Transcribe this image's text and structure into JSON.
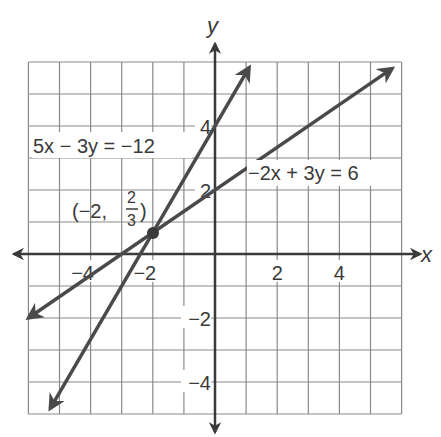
{
  "chart_data": {
    "type": "line",
    "title": "",
    "xlabel": "x",
    "ylabel": "y",
    "xlim": [
      -6,
      6
    ],
    "ylim": [
      -5,
      6
    ],
    "grid": true,
    "grid_step": 1,
    "x_ticks": [
      {
        "value": -4,
        "label": "−4"
      },
      {
        "value": -2,
        "label": "−2"
      },
      {
        "value": 2,
        "label": "2"
      },
      {
        "value": 4,
        "label": "4"
      }
    ],
    "y_ticks": [
      {
        "value": 4,
        "label": "4"
      },
      {
        "value": 2,
        "label": "2"
      },
      {
        "value": -2,
        "label": "−2"
      },
      {
        "value": -4,
        "label": "−4"
      }
    ],
    "series": [
      {
        "name": "5x − 3y = −12",
        "equation": "y = (5/3)x + 4",
        "slope": 1.6667,
        "intercept": 4,
        "x": [
          -5.3,
          1.1
        ],
        "y": [
          -4.83,
          5.83
        ]
      },
      {
        "name": "−2x + 3y = 6",
        "equation": "y = (2/3)x + 2",
        "slope": 0.6667,
        "intercept": 2,
        "x": [
          -6,
          5.7
        ],
        "y": [
          -2,
          5.8
        ]
      }
    ],
    "annotations": [
      {
        "text": "5x − 3y = −12",
        "x": -5.8,
        "y": 3.2
      },
      {
        "text": "−2x + 3y = 6",
        "x": 0.2,
        "y": 2.3
      },
      {
        "text": "(−2, 2/3)",
        "point": [
          -2,
          0.6667
        ],
        "x": -4.4,
        "y": 1.2
      }
    ],
    "intersection": {
      "x": -2,
      "y": 0.6667,
      "label_prefix": "(−2,",
      "frac_num": "2",
      "frac_den": "3",
      "label_suffix": ")"
    }
  },
  "labels": {
    "x_axis": "x",
    "y_axis": "y",
    "eq1": "5x − 3y = −12",
    "eq2": "−2x + 3y = 6",
    "point_prefix": "(−2,",
    "point_num": "2",
    "point_den": "3",
    "point_suffix": ")"
  },
  "colors": {
    "grid": "#8a8a8a",
    "axis": "#3a3a3a",
    "line": "#4a4a4a",
    "text": "#3a3a3a"
  }
}
